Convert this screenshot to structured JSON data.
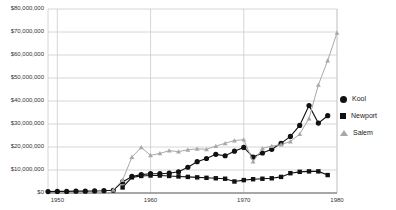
{
  "chart_data": {
    "type": "line",
    "title": "",
    "xlabel": "",
    "ylabel": "",
    "xlim": [
      1949,
      1980
    ],
    "ylim": [
      0,
      80000000
    ],
    "grid": true,
    "legend_position": "right",
    "y_ticks": [
      0,
      10000000,
      20000000,
      30000000,
      40000000,
      50000000,
      60000000,
      70000000,
      80000000
    ],
    "y_tick_labels": [
      "$0",
      "$10,000,000",
      "$20,000,000",
      "$30,000,000",
      "$40,000,000",
      "$50,000,000",
      "$60,000,000",
      "$70,000,000",
      "$80,000,000"
    ],
    "x_ticks": [
      1950,
      1960,
      1970,
      1980
    ],
    "x_tick_labels": [
      "1950",
      "1960",
      "1970",
      "1980"
    ],
    "series": [
      {
        "name": "Kool",
        "marker": "circle",
        "color": "#111111",
        "x": [
          1949,
          1950,
          1951,
          1952,
          1953,
          1954,
          1955,
          1956,
          1957,
          1958,
          1959,
          1960,
          1961,
          1962,
          1963,
          1964,
          1965,
          1966,
          1967,
          1968,
          1969,
          1970,
          1971,
          1972,
          1973,
          1974,
          1975,
          1976,
          1977,
          1978,
          1979
        ],
        "y": [
          600000,
          700000,
          700000,
          800000,
          800000,
          900000,
          1000000,
          1200000,
          4800000,
          7200000,
          8000000,
          8400000,
          8400000,
          8600000,
          9200000,
          11200000,
          13600000,
          15000000,
          16800000,
          16200000,
          18200000,
          19800000,
          15600000,
          17400000,
          19000000,
          21600000,
          24600000,
          29400000,
          38000000,
          30400000,
          33600000
        ]
      },
      {
        "name": "Newport",
        "marker": "square",
        "color": "#111111",
        "x": [
          1957,
          1958,
          1959,
          1960,
          1961,
          1962,
          1963,
          1964,
          1965,
          1966,
          1967,
          1968,
          1969,
          1970,
          1971,
          1972,
          1973,
          1974,
          1975,
          1976,
          1977,
          1978,
          1979
        ],
        "y": [
          2400000,
          6800000,
          7400000,
          7600000,
          7600000,
          7400000,
          7200000,
          7000000,
          6800000,
          6600000,
          6400000,
          6200000,
          5000000,
          5600000,
          6000000,
          6200000,
          6400000,
          7000000,
          8600000,
          9200000,
          9400000,
          9400000,
          7800000
        ]
      },
      {
        "name": "Salem",
        "marker": "triangle",
        "color": "#a8a8a8",
        "x": [
          1956,
          1957,
          1958,
          1959,
          1960,
          1961,
          1962,
          1963,
          1964,
          1965,
          1966,
          1967,
          1968,
          1969,
          1970,
          1971,
          1972,
          1973,
          1974,
          1975,
          1976,
          1977,
          1978,
          1979,
          1980
        ],
        "y": [
          1400000,
          5600000,
          15600000,
          19800000,
          16400000,
          17200000,
          18400000,
          18000000,
          18800000,
          19200000,
          19000000,
          20400000,
          21600000,
          22800000,
          23200000,
          13600000,
          19400000,
          20400000,
          21000000,
          22400000,
          25600000,
          32400000,
          47000000,
          57600000,
          69600000
        ]
      }
    ]
  },
  "legend": {
    "items": [
      {
        "label": "Kool",
        "marker": "circle"
      },
      {
        "label": "Newport",
        "marker": "square"
      },
      {
        "label": "Salem",
        "marker": "triangle"
      }
    ]
  },
  "colors": {
    "kool": "#111111",
    "newport": "#111111",
    "salem": "#a8a8a8",
    "grid": "#cccccc",
    "axis": "#999999",
    "text": "#333333"
  }
}
